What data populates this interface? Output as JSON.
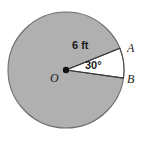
{
  "figure": {
    "type": "circle-sector-geometry-diagram",
    "background_color": "#ffffff",
    "circle": {
      "fill_color": "#b0b0b0",
      "stroke_color": "#6e6e6e",
      "center_x": 66,
      "center_y": 70,
      "radius": 58
    },
    "sector": {
      "fill_color": "#ffffff",
      "stroke_color": "#4a4a4a",
      "start_angle_deg": -22,
      "end_angle_deg": 8,
      "central_angle_deg": 30
    },
    "center_point": {
      "label": "O",
      "dot_color": "#111111",
      "dot_radius": 3.2
    },
    "labels": {
      "radius_measure": "6 ft",
      "angle_measure": "30°",
      "point_a": "A",
      "point_b": "B",
      "point_o": "O"
    }
  },
  "chart_data": {
    "type": "diagram",
    "title": "",
    "shape": "circle with highlighted sector",
    "radius": 6,
    "radius_units": "ft",
    "central_angle": 30,
    "central_angle_units": "degrees",
    "points": [
      {
        "name": "O",
        "role": "center"
      },
      {
        "name": "A",
        "role": "sector-endpoint-upper"
      },
      {
        "name": "B",
        "role": "sector-endpoint-lower"
      }
    ],
    "annotations": [
      "6 ft",
      "30°",
      "A",
      "B",
      "O"
    ]
  }
}
